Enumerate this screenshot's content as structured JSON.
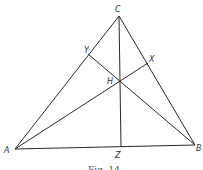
{
  "diagram": {
    "type": "geometry",
    "points": {
      "A": {
        "label": "A",
        "x": 15,
        "y": 149
      },
      "B": {
        "label": "B",
        "x": 195,
        "y": 145
      },
      "C": {
        "label": "C",
        "x": 119,
        "y": 16
      },
      "X": {
        "label": "X",
        "x": 148,
        "y": 63
      },
      "Y": {
        "label": "Y",
        "x": 88,
        "y": 54
      },
      "Z": {
        "label": "Z",
        "x": 121,
        "y": 147
      },
      "H": {
        "label": "H",
        "x": 119,
        "y": 80
      }
    },
    "segments": [
      [
        "A",
        "B"
      ],
      [
        "B",
        "C"
      ],
      [
        "C",
        "A"
      ],
      [
        "A",
        "X"
      ],
      [
        "B",
        "Y"
      ],
      [
        "C",
        "Z"
      ]
    ],
    "caption": "Fig. 14",
    "line_color": "#2a2a2a"
  }
}
